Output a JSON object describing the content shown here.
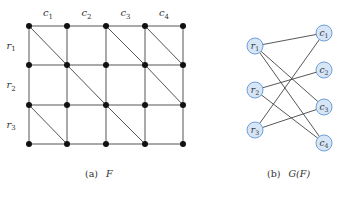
{
  "panel_a": {
    "caption_label": "(a)",
    "caption_var": "F",
    "col_labels": [
      "c1",
      "c2",
      "c3",
      "c4"
    ],
    "row_labels": [
      "r1",
      "r2",
      "r3"
    ],
    "grid": {
      "node_cols": 5,
      "node_rows": 4
    },
    "diagonals": [
      [
        [
          0,
          0
        ],
        [
          1,
          1
        ]
      ],
      [
        [
          2,
          0
        ],
        [
          3,
          1
        ]
      ],
      [
        [
          3,
          0
        ],
        [
          4,
          1
        ]
      ],
      [
        [
          1,
          1
        ],
        [
          2,
          2
        ]
      ],
      [
        [
          3,
          1
        ],
        [
          4,
          2
        ]
      ],
      [
        [
          0,
          2
        ],
        [
          1,
          3
        ]
      ],
      [
        [
          2,
          2
        ],
        [
          3,
          3
        ]
      ]
    ]
  },
  "panel_b": {
    "caption_label": "(b)",
    "caption_var": "G(F)",
    "left_nodes": [
      "r1",
      "r2",
      "r3"
    ],
    "right_nodes": [
      "c1",
      "c2",
      "c3",
      "c4"
    ],
    "edges": [
      [
        "r1",
        "c1"
      ],
      [
        "r1",
        "c3"
      ],
      [
        "r1",
        "c4"
      ],
      [
        "r2",
        "c2"
      ],
      [
        "r2",
        "c4"
      ],
      [
        "r3",
        "c1"
      ],
      [
        "r3",
        "c3"
      ]
    ],
    "colors": {
      "node_fill": "#d6e6f7",
      "node_stroke": "#6f9fd8"
    }
  }
}
